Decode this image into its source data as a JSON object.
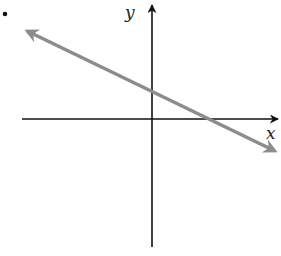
{
  "figure": {
    "bullet": "•",
    "axes": {
      "x_label": "x",
      "y_label": "y",
      "x_axis_y": 119,
      "y_axis_x": 152,
      "axis_color": "#111111"
    },
    "line": {
      "description": "Straight line with negative slope and positive y-intercept, arrows on both ends",
      "color": "#8c8c8c",
      "start": [
        25,
        30
      ],
      "end": [
        277,
        152
      ],
      "y_intercept_px": [
        152,
        89
      ],
      "x_intercept_px": [
        210,
        119
      ]
    }
  }
}
